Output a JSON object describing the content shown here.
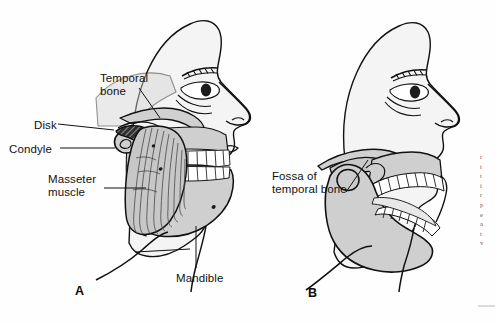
{
  "figure": {
    "background_color": "#fefefe",
    "ink_color": "#111111",
    "bone_fill": "#cfcfcf",
    "muscle_fill": "#c7c7c7",
    "tooth_fill": "#ffffff",
    "disk_fill": "#2a2a2a",
    "panels": [
      {
        "letter": "A",
        "caption": "Closed mouth: masseter muscle, condyle, disk and temporal bone",
        "letter_x": 75,
        "letter_y": 284
      },
      {
        "letter": "B",
        "caption": "Open mouth: condyle translated out of the fossa of the temporal bone",
        "letter_x": 308,
        "letter_y": 286
      }
    ],
    "labels": [
      {
        "text": "Temporal\nbone",
        "x": 100,
        "y": 72,
        "align": "left"
      },
      {
        "text": "Disk",
        "x": 34,
        "y": 119,
        "align": "left"
      },
      {
        "text": "Condyle",
        "x": 9,
        "y": 143,
        "align": "left"
      },
      {
        "text": "Masseter\nmuscle",
        "x": 48,
        "y": 173,
        "align": "left"
      },
      {
        "text": "Mandible",
        "x": 176,
        "y": 272,
        "align": "left"
      },
      {
        "text": "Fossa of\ntemporal bone",
        "x": 272,
        "y": 170,
        "align": "left"
      }
    ],
    "edge_column_fragments": [
      "r",
      "t",
      "t",
      "i",
      "r",
      "p",
      "e",
      "a",
      "t",
      "v"
    ]
  }
}
